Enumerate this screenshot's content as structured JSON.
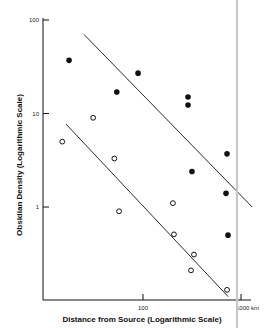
{
  "chart_data": {
    "type": "scatter",
    "title": "",
    "xlabel": "Distance from Source (Logarithmic Scale)",
    "ylabel": "Obsidian Density (Logarithmic Scale)",
    "xscale": "log",
    "yscale": "log",
    "xlim": [
      10,
      1300
    ],
    "ylim": [
      0.1,
      100
    ],
    "x_ticks": [
      {
        "value": 100,
        "label": "100"
      },
      {
        "value": 1000,
        "label": "1000 km"
      }
    ],
    "y_ticks": [
      {
        "value": 100,
        "label": "100"
      },
      {
        "value": 10,
        "label": "10"
      },
      {
        "value": 1,
        "label": "1"
      }
    ],
    "grid": false,
    "legend": null,
    "series": [
      {
        "name": "filled",
        "marker": "filled-circle",
        "points": [
          {
            "x": 17.6,
            "y": 37
          },
          {
            "x": 54,
            "y": 17
          },
          {
            "x": 89,
            "y": 27
          },
          {
            "x": 288,
            "y": 15
          },
          {
            "x": 288,
            "y": 12.3
          },
          {
            "x": 316,
            "y": 2.4
          },
          {
            "x": 720,
            "y": 3.7
          },
          {
            "x": 703,
            "y": 1.4
          },
          {
            "x": 737,
            "y": 0.5
          }
        ],
        "trendline": {
          "from": {
            "x": 25,
            "y": 70
          },
          "to": {
            "x": 1300,
            "y": 1.0
          }
        }
      },
      {
        "name": "open",
        "marker": "open-circle",
        "points": [
          {
            "x": 15,
            "y": 5
          },
          {
            "x": 31,
            "y": 9
          },
          {
            "x": 51,
            "y": 3.3
          },
          {
            "x": 57,
            "y": 0.9
          },
          {
            "x": 202,
            "y": 1.1
          },
          {
            "x": 207,
            "y": 0.51
          },
          {
            "x": 331,
            "y": 0.31
          },
          {
            "x": 309,
            "y": 0.21
          },
          {
            "x": 720,
            "y": 0.13
          }
        ],
        "trendline": {
          "from": {
            "x": 16.4,
            "y": 7.7
          },
          "to": {
            "x": 740,
            "y": 0.11
          }
        }
      }
    ],
    "annotations": [
      {
        "type": "vertical-rule",
        "color": "#c8c8c8"
      }
    ]
  },
  "layout": {
    "plot": {
      "x0": 43,
      "y_axis_top": 18,
      "x_axis_y": 300,
      "x_axis_end": 251
    },
    "xmap": {
      "log_at_x0": 1,
      "px_per_decade": 98,
      "origin_px": 45
    },
    "ymap": {
      "log_top": 2,
      "top_px": 20,
      "px_per_decade": 93.5
    },
    "vertical_rule_x": 237,
    "colors": {
      "ink": "#111111",
      "rule": "#c8c8c8",
      "bg": "#ffffff"
    }
  }
}
